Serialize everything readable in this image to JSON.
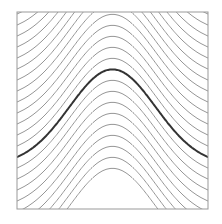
{
  "diagram": {
    "type": "level-set curves of shifted Gaussian",
    "frame": {
      "x": 17,
      "y": 12,
      "width": 191,
      "height": 197,
      "stroke": "#999999"
    },
    "curves": {
      "amplitude": 96,
      "sigma_fraction": 0.32,
      "spacing": 11,
      "bold_edge_y": 157,
      "count_above": 14,
      "count_below": 9,
      "color": "#8a8a8a",
      "bold_color": "#333333",
      "width": 0.9,
      "bold_width": 2
    }
  }
}
